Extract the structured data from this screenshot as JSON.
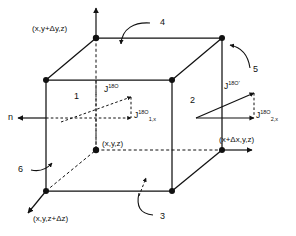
{
  "diagram": {
    "vertex_labels": {
      "top_back_left": "(x,y+Δy,z)",
      "center": "(x,y,z)",
      "bottom_front_left": "(x,y,z+Δz)",
      "bottom_back_right": "(x+Δx,y,z)"
    },
    "face_numbers": {
      "face_1": "1",
      "face_2": "2",
      "face_3": "3",
      "face_4": "4",
      "face_5": "5",
      "face_6": "6"
    },
    "normal_label": "n",
    "fluxes": {
      "left_vector": {
        "base": "J",
        "sup": "18O",
        "sub": ""
      },
      "left_component": {
        "base": "J",
        "sup": "18O",
        "sub": "1,x"
      },
      "right_vector": {
        "base": "J",
        "sup": "18O'",
        "sub": ""
      },
      "right_component": {
        "base": "J",
        "sup": "18O",
        "sub": "2,x"
      }
    },
    "colors": {
      "ink": "#111111",
      "background": "#ffffff"
    }
  }
}
